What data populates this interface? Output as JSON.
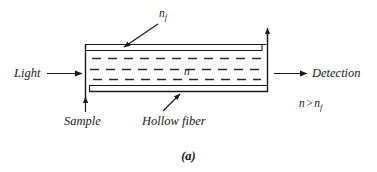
{
  "figure": {
    "caption": "(a)",
    "line_color": "#1a1a1a",
    "background": "#ffffff"
  },
  "labels": {
    "light": "Light",
    "detection": "Detection",
    "sample": "Sample",
    "hollow_fiber": "Hollow fiber",
    "cladding_index": "n",
    "cladding_index_sub": "f",
    "core_index": "n",
    "inequality": {
      "left": "n",
      "operator": ">",
      "right": "n",
      "right_sub": "f"
    }
  },
  "icons": {
    "light_arrow": "arrow-right-icon",
    "detection_arrow": "arrow-right-icon",
    "sample_arrow": "arrow-up-icon",
    "outlet_arrow": "arrow-up-icon",
    "nf_leader": "leader-arrow-icon",
    "hollow_fiber_leader": "leader-arrow-icon"
  },
  "geometry": {
    "tube_left_x": 85,
    "tube_right_x": 268,
    "tube_top_y": 44,
    "tube_bottom_y": 92,
    "dash_rows": 3
  }
}
